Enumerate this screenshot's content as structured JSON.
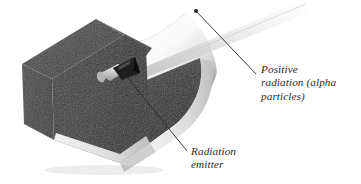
{
  "figure": {
    "background_color": "#ffffff"
  },
  "callouts": [
    {
      "id": "positive-radiation",
      "lines": [
        "Positive",
        "radiation (alpha",
        "particles)"
      ],
      "text": "Positive radiation (alpha particles)",
      "line_1": "Positive",
      "line_2": "radiation (alpha",
      "line_3": "particles)",
      "leader": {
        "dot_x": 196,
        "dot_y": 11,
        "end_x": 256,
        "end_y": 74
      }
    },
    {
      "id": "radiation-emitter",
      "lines": [
        "Radiation",
        "emitter"
      ],
      "text": "Radiation emitter",
      "line_1": "Radiation",
      "line_2": "emitter",
      "leader": {
        "start_x": 127,
        "start_y": 77,
        "end_x": 187,
        "end_y": 151
      }
    }
  ],
  "colors": {
    "box_dark": "#3c3c3c",
    "box_top_rim": "#4a4a4a",
    "box_front_shadow": "#2e2e2e",
    "box_edge_light": "#e8e8e8",
    "interior_light": "#fbfbfb",
    "interior_shade": "#6a6a6a",
    "emitter_body": "#d8d8d8",
    "emitter_cone": "#1c1c1c",
    "beam": "#d5d5d5",
    "leader_line": "#2b2b2b",
    "text": "#2b2b2b"
  },
  "objects": {
    "box_label": "open-top rectangular lead box",
    "emitter_label": "cone-shaped radiation emitter",
    "beam_label": "alpha particle beam streak"
  }
}
